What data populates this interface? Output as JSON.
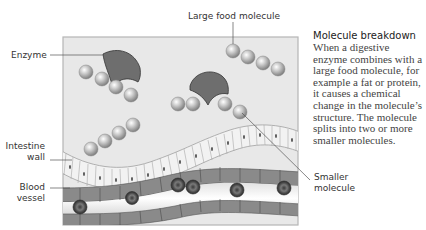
{
  "labels": {
    "large_food_molecule": "Large food molecule",
    "enzyme": "Enzyme",
    "intestine_wall_line1": "Intestine",
    "intestine_wall_line2": "wall",
    "blood_vessel_line1": "Blood",
    "blood_vessel_line2": "vessel",
    "smaller_molecule_line1": "Smaller",
    "smaller_molecule_line2": "molecule"
  },
  "sidebar": {
    "title": "Molecule breakdown",
    "body": "When a digestive enzyme combines with a large food molecule, for example a fat or protein, it causes a chemical change in the molecule’s structure. The molecule splits into two or more smaller molecules."
  },
  "colors": {
    "panel": "#e6e6e6",
    "enzyme": "#6e6e6e",
    "bead": "#bdbdbd",
    "vessel_wall": "#7d7d7d",
    "blood_cell": "#5a5a5a",
    "text": "#333333"
  }
}
